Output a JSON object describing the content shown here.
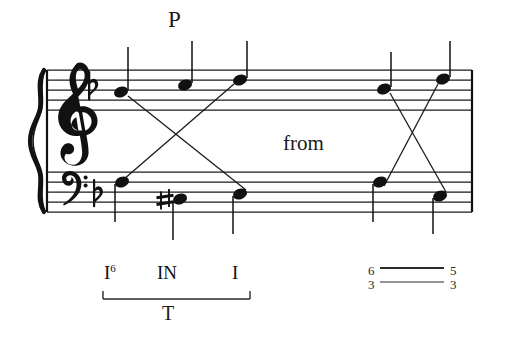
{
  "figure": {
    "kind": "music-notation-grand-staff",
    "ink_color": "#111111",
    "background_color": "#ffffff"
  },
  "annotations": {
    "passing_tone_label": "P",
    "from_label": "from"
  },
  "staff": {
    "treble": {
      "clef": "treble-clef",
      "key_signature": "flat",
      "notes": [
        {
          "id": "t1",
          "x": 121,
          "y": 92,
          "stem": "up"
        },
        {
          "id": "t2",
          "x": 185,
          "y": 85,
          "stem": "up"
        },
        {
          "id": "t3",
          "x": 240,
          "y": 80,
          "stem": "up"
        },
        {
          "id": "t4",
          "x": 384,
          "y": 89,
          "stem": "up"
        },
        {
          "id": "t5",
          "x": 443,
          "y": 79,
          "stem": "up"
        }
      ]
    },
    "bass": {
      "clef": "bass-clef",
      "key_signature": "flat",
      "notes": [
        {
          "id": "b1",
          "x": 122,
          "y": 182,
          "stem": "down",
          "accidental": ""
        },
        {
          "id": "b2",
          "x": 180,
          "y": 199,
          "stem": "down",
          "accidental": "sharp"
        },
        {
          "id": "b3",
          "x": 240,
          "y": 194,
          "stem": "down",
          "accidental": ""
        },
        {
          "id": "b4",
          "x": 380,
          "y": 182,
          "stem": "down",
          "accidental": ""
        },
        {
          "id": "b5",
          "x": 440,
          "y": 196,
          "stem": "down",
          "accidental": ""
        }
      ]
    }
  },
  "analysis": {
    "roman_numerals": [
      {
        "numeral": "I",
        "figure": "6"
      },
      {
        "numeral": "IN",
        "figure": ""
      },
      {
        "numeral": "I",
        "figure": ""
      }
    ],
    "function_bracket_label": "T",
    "figured_bass": {
      "left_top": "6",
      "left_bottom": "3",
      "right_top": "5",
      "right_bottom": "3"
    }
  }
}
